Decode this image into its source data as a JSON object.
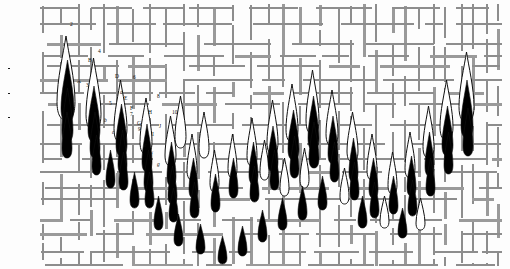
{
  "figure": {
    "type": "annotated-spectrum",
    "background_color": "#fdfdfd",
    "grid_color": "#8d8d8d",
    "peak_outline_color": "#111111",
    "peak_fill_color": "#000000",
    "width": 510,
    "height": 269
  },
  "axis_labels": [
    {
      "bracket_open": "⟨",
      "symbol": "J",
      "bracket_close": "⟩",
      "subscript_numerator": "1",
      "subscript_denominator": "",
      "style": "plain",
      "top": 42
    },
    {
      "bracket_open": "⟨",
      "symbol": "J",
      "bracket_close": "⟩",
      "subscript_numerator": "A",
      "subscript_denominator": "A",
      "style": "fraction",
      "top": 67
    },
    {
      "bracket_open": "⟨",
      "symbol": "J",
      "bracket_close": "⟩",
      "subscript_numerator": "a",
      "subscript_denominator": "a",
      "style": "fraction",
      "top": 92
    },
    {
      "bracket_open": "⟨",
      "symbol": "J",
      "bracket_close": "⟩",
      "subscript_numerator": "AA",
      "subscript_denominator": "AA",
      "style": "fraction",
      "top": 116
    }
  ],
  "peak_annotations": [
    {
      "text": "2",
      "x": 70,
      "y": 22
    },
    {
      "text": "4",
      "x": 98,
      "y": 49
    },
    {
      "text": "B",
      "x": 88,
      "y": 58
    },
    {
      "text": "D",
      "x": 115,
      "y": 74
    },
    {
      "text": "6",
      "x": 133,
      "y": 75
    },
    {
      "text": "A",
      "x": 77,
      "y": 79
    },
    {
      "text": "3",
      "x": 86,
      "y": 83
    },
    {
      "text": "d",
      "x": 120,
      "y": 90
    },
    {
      "text": "E",
      "x": 124,
      "y": 96
    },
    {
      "text": "8",
      "x": 157,
      "y": 94
    },
    {
      "text": "C",
      "x": 91,
      "y": 100
    },
    {
      "text": "5",
      "x": 109,
      "y": 101
    },
    {
      "text": "F",
      "x": 130,
      "y": 106
    },
    {
      "text": "7",
      "x": 130,
      "y": 112
    },
    {
      "text": "H",
      "x": 148,
      "y": 110
    },
    {
      "text": "10",
      "x": 172,
      "y": 110
    },
    {
      "text": "G",
      "x": 137,
      "y": 121
    },
    {
      "text": "9",
      "x": 138,
      "y": 127
    },
    {
      "text": "J",
      "x": 159,
      "y": 124
    },
    {
      "text": "I",
      "x": 152,
      "y": 132
    },
    {
      "text": "b",
      "x": 104,
      "y": 118
    },
    {
      "text": "c",
      "x": 112,
      "y": 130
    },
    {
      "text": "e",
      "x": 144,
      "y": 143
    },
    {
      "text": "f",
      "x": 151,
      "y": 152
    },
    {
      "text": "g",
      "x": 157,
      "y": 162
    }
  ],
  "chart_data": {
    "type": "scatter",
    "title": "",
    "xlabel": "",
    "ylabel": "",
    "legend": [],
    "grid": true,
    "note": "Each datum is a narrow flame/teardrop peak; 'filled' peaks are solid black, 'open' peaks are white with a black outline. x and y are pixel positions of the peak apex; h is peak height in pixels.",
    "peaks": [
      {
        "x": 66,
        "y": 36,
        "h": 84,
        "fill": "open"
      },
      {
        "x": 67,
        "y": 60,
        "h": 62,
        "fill": "filled"
      },
      {
        "x": 67,
        "y": 88,
        "h": 54,
        "fill": "filled"
      },
      {
        "x": 67,
        "y": 112,
        "h": 46,
        "fill": "filled"
      },
      {
        "x": 93,
        "y": 58,
        "h": 72,
        "fill": "open"
      },
      {
        "x": 94,
        "y": 86,
        "h": 56,
        "fill": "filled"
      },
      {
        "x": 95,
        "y": 112,
        "h": 46,
        "fill": "filled"
      },
      {
        "x": 96,
        "y": 135,
        "h": 40,
        "fill": "filled"
      },
      {
        "x": 120,
        "y": 80,
        "h": 62,
        "fill": "open"
      },
      {
        "x": 121,
        "y": 104,
        "h": 52,
        "fill": "filled"
      },
      {
        "x": 122,
        "y": 130,
        "h": 44,
        "fill": "filled"
      },
      {
        "x": 123,
        "y": 152,
        "h": 38,
        "fill": "filled"
      },
      {
        "x": 146,
        "y": 98,
        "h": 56,
        "fill": "open"
      },
      {
        "x": 147,
        "y": 124,
        "h": 48,
        "fill": "filled"
      },
      {
        "x": 148,
        "y": 150,
        "h": 42,
        "fill": "filled"
      },
      {
        "x": 149,
        "y": 172,
        "h": 36,
        "fill": "filled"
      },
      {
        "x": 170,
        "y": 116,
        "h": 50,
        "fill": "open"
      },
      {
        "x": 171,
        "y": 142,
        "h": 44,
        "fill": "filled"
      },
      {
        "x": 172,
        "y": 166,
        "h": 38,
        "fill": "filled"
      },
      {
        "x": 173,
        "y": 188,
        "h": 34,
        "fill": "filled"
      },
      {
        "x": 192,
        "y": 134,
        "h": 46,
        "fill": "open"
      },
      {
        "x": 193,
        "y": 158,
        "h": 40,
        "fill": "filled"
      },
      {
        "x": 194,
        "y": 182,
        "h": 36,
        "fill": "filled"
      },
      {
        "x": 214,
        "y": 150,
        "h": 42,
        "fill": "open"
      },
      {
        "x": 215,
        "y": 174,
        "h": 38,
        "fill": "filled"
      },
      {
        "x": 232,
        "y": 134,
        "h": 44,
        "fill": "open"
      },
      {
        "x": 233,
        "y": 158,
        "h": 40,
        "fill": "filled"
      },
      {
        "x": 252,
        "y": 118,
        "h": 48,
        "fill": "open"
      },
      {
        "x": 253,
        "y": 142,
        "h": 42,
        "fill": "filled"
      },
      {
        "x": 254,
        "y": 166,
        "h": 36,
        "fill": "filled"
      },
      {
        "x": 272,
        "y": 100,
        "h": 54,
        "fill": "open"
      },
      {
        "x": 273,
        "y": 126,
        "h": 46,
        "fill": "filled"
      },
      {
        "x": 274,
        "y": 150,
        "h": 40,
        "fill": "filled"
      },
      {
        "x": 292,
        "y": 84,
        "h": 58,
        "fill": "open"
      },
      {
        "x": 293,
        "y": 110,
        "h": 50,
        "fill": "filled"
      },
      {
        "x": 294,
        "y": 136,
        "h": 42,
        "fill": "filled"
      },
      {
        "x": 312,
        "y": 70,
        "h": 64,
        "fill": "open"
      },
      {
        "x": 313,
        "y": 96,
        "h": 54,
        "fill": "filled"
      },
      {
        "x": 314,
        "y": 122,
        "h": 46,
        "fill": "filled"
      },
      {
        "x": 332,
        "y": 90,
        "h": 56,
        "fill": "open"
      },
      {
        "x": 333,
        "y": 116,
        "h": 48,
        "fill": "filled"
      },
      {
        "x": 334,
        "y": 142,
        "h": 40,
        "fill": "filled"
      },
      {
        "x": 352,
        "y": 112,
        "h": 50,
        "fill": "open"
      },
      {
        "x": 353,
        "y": 138,
        "h": 44,
        "fill": "filled"
      },
      {
        "x": 354,
        "y": 162,
        "h": 38,
        "fill": "filled"
      },
      {
        "x": 372,
        "y": 134,
        "h": 46,
        "fill": "open"
      },
      {
        "x": 373,
        "y": 158,
        "h": 40,
        "fill": "filled"
      },
      {
        "x": 374,
        "y": 182,
        "h": 36,
        "fill": "filled"
      },
      {
        "x": 392,
        "y": 152,
        "h": 42,
        "fill": "open"
      },
      {
        "x": 393,
        "y": 176,
        "h": 38,
        "fill": "filled"
      },
      {
        "x": 410,
        "y": 132,
        "h": 46,
        "fill": "open"
      },
      {
        "x": 411,
        "y": 156,
        "h": 40,
        "fill": "filled"
      },
      {
        "x": 412,
        "y": 180,
        "h": 36,
        "fill": "filled"
      },
      {
        "x": 428,
        "y": 106,
        "h": 52,
        "fill": "open"
      },
      {
        "x": 429,
        "y": 132,
        "h": 44,
        "fill": "filled"
      },
      {
        "x": 430,
        "y": 158,
        "h": 38,
        "fill": "filled"
      },
      {
        "x": 446,
        "y": 80,
        "h": 60,
        "fill": "open"
      },
      {
        "x": 447,
        "y": 106,
        "h": 50,
        "fill": "filled"
      },
      {
        "x": 448,
        "y": 132,
        "h": 42,
        "fill": "filled"
      },
      {
        "x": 466,
        "y": 52,
        "h": 70,
        "fill": "open"
      },
      {
        "x": 467,
        "y": 80,
        "h": 58,
        "fill": "filled"
      },
      {
        "x": 468,
        "y": 108,
        "h": 48,
        "fill": "filled"
      },
      {
        "x": 180,
        "y": 96,
        "h": 52,
        "fill": "open"
      },
      {
        "x": 204,
        "y": 112,
        "h": 46,
        "fill": "open"
      },
      {
        "x": 264,
        "y": 140,
        "h": 40,
        "fill": "open"
      },
      {
        "x": 284,
        "y": 158,
        "h": 38,
        "fill": "open"
      },
      {
        "x": 304,
        "y": 148,
        "h": 40,
        "fill": "open"
      },
      {
        "x": 344,
        "y": 168,
        "h": 36,
        "fill": "open"
      },
      {
        "x": 384,
        "y": 196,
        "h": 32,
        "fill": "open"
      },
      {
        "x": 420,
        "y": 198,
        "h": 32,
        "fill": "open"
      },
      {
        "x": 110,
        "y": 150,
        "h": 38,
        "fill": "filled"
      },
      {
        "x": 134,
        "y": 172,
        "h": 36,
        "fill": "filled"
      },
      {
        "x": 158,
        "y": 196,
        "h": 34,
        "fill": "filled"
      },
      {
        "x": 178,
        "y": 214,
        "h": 32,
        "fill": "filled"
      },
      {
        "x": 200,
        "y": 224,
        "h": 30,
        "fill": "filled"
      },
      {
        "x": 222,
        "y": 236,
        "h": 28,
        "fill": "filled"
      },
      {
        "x": 242,
        "y": 226,
        "h": 30,
        "fill": "filled"
      },
      {
        "x": 262,
        "y": 210,
        "h": 32,
        "fill": "filled"
      },
      {
        "x": 282,
        "y": 198,
        "h": 32,
        "fill": "filled"
      },
      {
        "x": 302,
        "y": 186,
        "h": 34,
        "fill": "filled"
      },
      {
        "x": 322,
        "y": 176,
        "h": 34,
        "fill": "filled"
      },
      {
        "x": 362,
        "y": 196,
        "h": 32,
        "fill": "filled"
      },
      {
        "x": 402,
        "y": 208,
        "h": 30,
        "fill": "filled"
      }
    ]
  }
}
